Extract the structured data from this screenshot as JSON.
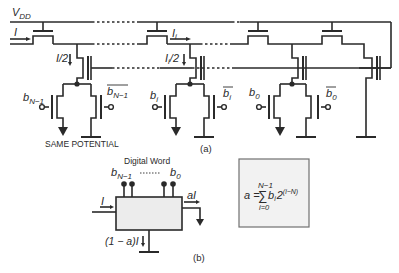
{
  "figure_a": {
    "supply_label": "V",
    "supply_sub": "DD",
    "input_current": "I",
    "branch_current_n1": "I/2",
    "branch_current_i": "I",
    "branch_current_i_sub": "i",
    "branch_current_i_half": "/2",
    "bit_labels": {
      "bn1": "b",
      "bn1_sub": "N−1",
      "bn1_bar": "b",
      "bn1_bar_sub": "N−1",
      "bi": "b",
      "bi_sub": "i",
      "bi_bar": "b",
      "bi_bar_sub": "i",
      "b0": "b",
      "b0_sub": "0",
      "b0_bar": "b",
      "b0_bar_sub": "0"
    },
    "note": "SAME POTENTIAL",
    "caption": "(a)"
  },
  "figure_b": {
    "digital_word_label": "Digital Word",
    "msb_label": "b",
    "msb_sub": "N−1",
    "lsb_label": "b",
    "lsb_sub": "0",
    "input_current": "I",
    "output_current": "aI",
    "remainder_current": "(1 − a)I",
    "caption": "(b)"
  },
  "equation": {
    "lhs": "a =",
    "sum_upper": "N−1",
    "sum_symbol": "∑",
    "sum_lower": "i=0",
    "term": "b",
    "term_sub": "i",
    "base": "2",
    "exponent": "(i−N)"
  },
  "colors": {
    "line": "#2a2a2a",
    "equation_box_border": "#707070",
    "background": "#ffffff"
  }
}
